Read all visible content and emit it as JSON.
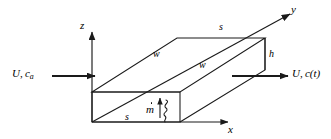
{
  "figure": {
    "type": "engineering-schematic"
  },
  "axes": {
    "z": {
      "label": "z"
    },
    "y": {
      "label": "y"
    },
    "x": {
      "label": "x"
    }
  },
  "dimensions": {
    "top_back_s": "s",
    "bottom_front_s": "s",
    "upper_w": "w",
    "lower_w": "w",
    "height_h": "h"
  },
  "flows": {
    "inlet": {
      "velocity": "U",
      "concentration": "c",
      "concentration_sub": "a"
    },
    "outlet": {
      "velocity": "U",
      "concentration": "c",
      "concentration_arg": "(t)"
    }
  },
  "source": {
    "label": "m",
    "accent": "dot"
  },
  "colors": {
    "stroke": "#1a1a1a",
    "background": "#ffffff",
    "text": "#000000"
  }
}
